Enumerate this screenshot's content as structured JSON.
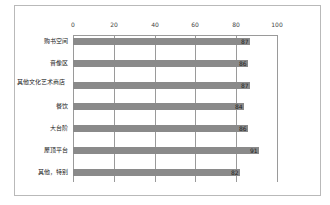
{
  "chart_data": {
    "type": "bar",
    "orientation": "horizontal",
    "title": "",
    "xlabel": "",
    "ylabel": "",
    "xlim": [
      0,
      100
    ],
    "x_ticks": [
      0,
      20,
      40,
      60,
      80,
      100
    ],
    "grid": true,
    "legend": null,
    "categories": [
      "购书空间",
      "音像区",
      "其他文化艺术商店",
      "餐饮",
      "大台阶",
      "屋顶平台",
      "其他，特别"
    ],
    "values": [
      87,
      86,
      87,
      84,
      86,
      91,
      82
    ],
    "data_labels": [
      "87",
      "86",
      "87",
      "84",
      "86",
      "91",
      "82"
    ],
    "bar_color": "#8a8a8a"
  },
  "axis": {
    "ticks": [
      "0",
      "20",
      "40",
      "60",
      "80",
      "100"
    ]
  },
  "bars": [
    {
      "label": "购书空间",
      "value": "87"
    },
    {
      "label": "音像区",
      "value": "86"
    },
    {
      "label": "其他文化艺术商店",
      "value": "87"
    },
    {
      "label": "餐饮",
      "value": "84"
    },
    {
      "label": "大台阶",
      "value": "86"
    },
    {
      "label": "屋顶平台",
      "value": "91"
    },
    {
      "label": "其他，特别",
      "value": "82"
    }
  ]
}
